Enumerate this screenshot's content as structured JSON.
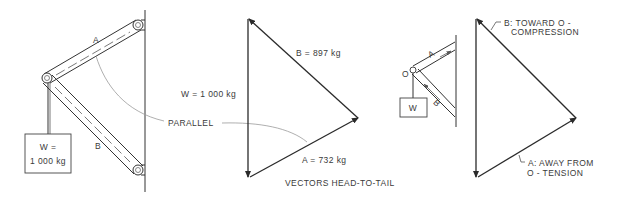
{
  "figure": {
    "left_diagram": {
      "member_a_label": "A",
      "member_b_label": "B",
      "weight_line1": "W =",
      "weight_line2": "1 000 kg"
    },
    "parallel_label": "PARALLEL",
    "middle_triangle": {
      "w_label": "W = 1 000 kg",
      "b_label": "B = 897 kg",
      "a_label": "A = 732 kg",
      "caption": "VECTORS HEAD-TO-TAIL"
    },
    "right_small_diagram": {
      "joint_label": "O",
      "member_a_label": "A",
      "member_b_label": "B",
      "weight_label": "W"
    },
    "right_triangle": {
      "b_line1": "B: TOWARD O -",
      "b_line2": "COMPRESSION",
      "a_line1": "A: AWAY FROM",
      "a_line2": "O - TENSION"
    },
    "values": {
      "W_kg": 1000,
      "A_kg": 732,
      "B_kg": 897
    }
  }
}
